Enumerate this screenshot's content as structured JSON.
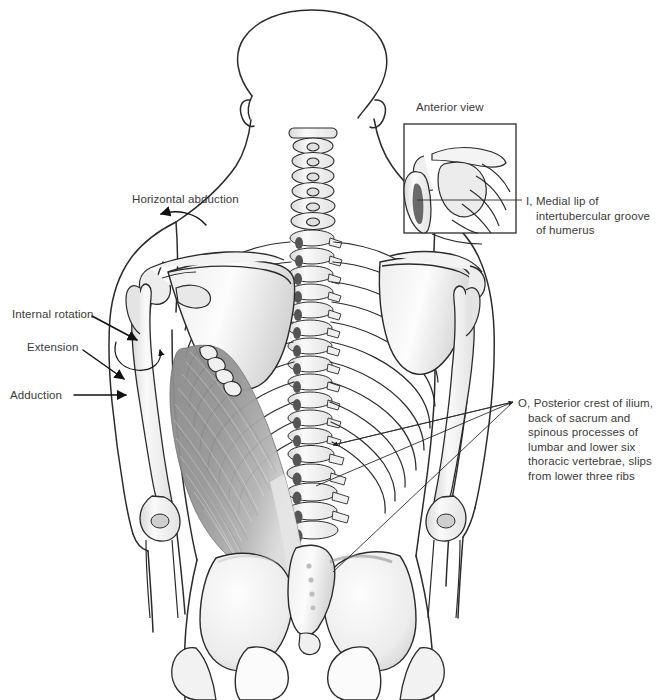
{
  "figure": {
    "view": "posterior",
    "ink_color": "#2b2b2b",
    "text_color": "#3a3a3a",
    "muscle_fill": "#8d8d8d",
    "bone_fill": "#f4f4f4",
    "background": "#ffffff"
  },
  "inset": {
    "caption": "Anterior view",
    "box": {
      "x": 404,
      "y": 124,
      "width": 112,
      "height": 109
    }
  },
  "labels": {
    "horizontal_abduction": "Horizontal abduction",
    "internal_rotation": "Internal rotation",
    "extension": "Extension",
    "adduction": "Adduction",
    "insertion": "I, Medial lip of intertubercular groove of humerus",
    "origin": "O, Posterior crest of ilium, back of sacrum and spinous processes of lumbar and lower six thoracic vertebrae, slips from lower three ribs"
  },
  "actions": [
    {
      "name": "Horizontal abduction",
      "arrow": "curved-left"
    },
    {
      "name": "Internal rotation",
      "arrow": "straight"
    },
    {
      "name": "Extension",
      "arrow": "straight"
    },
    {
      "name": "Adduction",
      "arrow": "straight"
    }
  ],
  "attachments": [
    {
      "key": "I",
      "label": "Medial lip of intertubercular groove of humerus",
      "leaders": 1
    },
    {
      "key": "O",
      "label": "Posterior crest of ilium, back of sacrum and spinous processes of lumbar and lower six thoracic vertebrae, slips from lower three ribs",
      "leaders": 3
    }
  ],
  "structures": [
    "skull",
    "cervical vertebrae",
    "thoracic vertebrae",
    "lumbar vertebrae",
    "ribs",
    "scapula",
    "clavicle",
    "humerus",
    "radius",
    "ulna",
    "sacrum",
    "ilium",
    "pelvis",
    "latissimus dorsi"
  ]
}
